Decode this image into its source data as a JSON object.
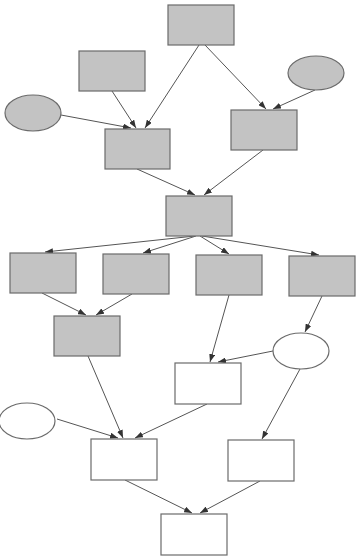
{
  "diagram": {
    "width": 361,
    "height": 560,
    "colors": {
      "background": "#ffffff",
      "filled_node": "#c3c3c3",
      "empty_node": "#ffffff",
      "stroke": "#6b6b6b",
      "edge": "#555555"
    },
    "nodes": [
      {
        "id": "A1",
        "shape": "rect",
        "filled": true,
        "x": 168,
        "y": 5,
        "w": 66,
        "h": 40
      },
      {
        "id": "A2",
        "shape": "rect",
        "filled": true,
        "x": 79,
        "y": 51,
        "w": 66,
        "h": 40
      },
      {
        "id": "EL1",
        "shape": "ellipse",
        "filled": true,
        "cx": 33,
        "cy": 113,
        "rx": 28,
        "ry": 18
      },
      {
        "id": "ER1",
        "shape": "ellipse",
        "filled": true,
        "cx": 316,
        "cy": 73,
        "rx": 28,
        "ry": 17
      },
      {
        "id": "B1",
        "shape": "rect",
        "filled": true,
        "x": 105,
        "y": 129,
        "w": 65,
        "h": 40
      },
      {
        "id": "B2",
        "shape": "rect",
        "filled": true,
        "x": 231,
        "y": 110,
        "w": 66,
        "h": 40
      },
      {
        "id": "C",
        "shape": "rect",
        "filled": true,
        "x": 166,
        "y": 196,
        "w": 66,
        "h": 40
      },
      {
        "id": "D1",
        "shape": "rect",
        "filled": true,
        "x": 10,
        "y": 253,
        "w": 66,
        "h": 40
      },
      {
        "id": "D2",
        "shape": "rect",
        "filled": true,
        "x": 103,
        "y": 254,
        "w": 66,
        "h": 40
      },
      {
        "id": "D3",
        "shape": "rect",
        "filled": true,
        "x": 196,
        "y": 255,
        "w": 66,
        "h": 40
      },
      {
        "id": "D4",
        "shape": "rect",
        "filled": true,
        "x": 289,
        "y": 256,
        "w": 66,
        "h": 40
      },
      {
        "id": "E1",
        "shape": "rect",
        "filled": true,
        "x": 54,
        "y": 316,
        "w": 66,
        "h": 40
      },
      {
        "id": "ER2",
        "shape": "ellipse",
        "filled": false,
        "cx": 301,
        "cy": 351,
        "rx": 28,
        "ry": 18
      },
      {
        "id": "E2",
        "shape": "rect",
        "filled": false,
        "x": 175,
        "y": 363,
        "w": 66,
        "h": 41
      },
      {
        "id": "EL2",
        "shape": "ellipse",
        "filled": false,
        "cx": 27,
        "cy": 421,
        "rx": 28,
        "ry": 18
      },
      {
        "id": "F1",
        "shape": "rect",
        "filled": false,
        "x": 91,
        "y": 439,
        "w": 66,
        "h": 41
      },
      {
        "id": "F2",
        "shape": "rect",
        "filled": false,
        "x": 228,
        "y": 440,
        "w": 66,
        "h": 41
      },
      {
        "id": "G",
        "shape": "rect",
        "filled": false,
        "x": 161,
        "y": 514,
        "w": 66,
        "h": 41
      }
    ],
    "edges": [
      {
        "from": "A1",
        "to": "B1",
        "x1": 199,
        "y1": 45,
        "x2": 145,
        "y2": 128
      },
      {
        "from": "A1",
        "to": "B2",
        "x1": 205,
        "y1": 45,
        "x2": 266,
        "y2": 109
      },
      {
        "from": "A2",
        "to": "B1",
        "x1": 112,
        "y1": 91,
        "x2": 136,
        "y2": 128
      },
      {
        "from": "EL1",
        "to": "B1",
        "x1": 61,
        "y1": 115,
        "x2": 131,
        "y2": 128
      },
      {
        "from": "ER1",
        "to": "B2",
        "x1": 315,
        "y1": 90,
        "x2": 273,
        "y2": 109
      },
      {
        "from": "B1",
        "to": "C",
        "x1": 137,
        "y1": 169,
        "x2": 195,
        "y2": 195
      },
      {
        "from": "B2",
        "to": "C",
        "x1": 263,
        "y1": 150,
        "x2": 204,
        "y2": 195
      },
      {
        "from": "C",
        "to": "D1",
        "x1": 195,
        "y1": 236,
        "x2": 45,
        "y2": 252
      },
      {
        "from": "C",
        "to": "D2",
        "x1": 196,
        "y1": 236,
        "x2": 143,
        "y2": 253
      },
      {
        "from": "C",
        "to": "D3",
        "x1": 200,
        "y1": 236,
        "x2": 229,
        "y2": 254
      },
      {
        "from": "C",
        "to": "D4",
        "x1": 202,
        "y1": 236,
        "x2": 319,
        "y2": 255
      },
      {
        "from": "D1",
        "to": "E1",
        "x1": 42,
        "y1": 293,
        "x2": 86,
        "y2": 315
      },
      {
        "from": "D2",
        "to": "E1",
        "x1": 132,
        "y1": 294,
        "x2": 96,
        "y2": 315
      },
      {
        "from": "D3",
        "to": "E2",
        "x1": 229,
        "y1": 295,
        "x2": 210,
        "y2": 362
      },
      {
        "from": "D4",
        "to": "ER2",
        "x1": 322,
        "y1": 296,
        "x2": 305,
        "y2": 332
      },
      {
        "from": "ER2",
        "to": "E2",
        "x1": 273,
        "y1": 351,
        "x2": 218,
        "y2": 362
      },
      {
        "from": "E1",
        "to": "F1",
        "x1": 88,
        "y1": 356,
        "x2": 123,
        "y2": 438
      },
      {
        "from": "E2",
        "to": "F1",
        "x1": 207,
        "y1": 404,
        "x2": 135,
        "y2": 438
      },
      {
        "from": "EL2",
        "to": "F1",
        "x1": 57,
        "y1": 419,
        "x2": 118,
        "y2": 438
      },
      {
        "from": "ER2",
        "to": "F2",
        "x1": 300,
        "y1": 369,
        "x2": 262,
        "y2": 439
      },
      {
        "from": "F1",
        "to": "G",
        "x1": 125,
        "y1": 480,
        "x2": 192,
        "y2": 513
      },
      {
        "from": "F2",
        "to": "G",
        "x1": 260,
        "y1": 481,
        "x2": 200,
        "y2": 513
      }
    ]
  }
}
